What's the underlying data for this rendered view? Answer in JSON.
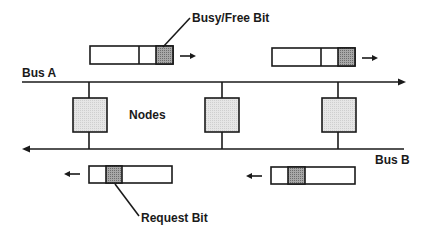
{
  "diagram": {
    "labels": {
      "busy_free_bit": "Busy/Free Bit",
      "bus_a": "Bus A",
      "nodes": "Nodes",
      "bus_b": "Bus B",
      "request_bit": "Request Bit"
    },
    "bus_a": {
      "direction": "right"
    },
    "bus_b": {
      "direction": "left"
    },
    "node_count": 3,
    "packets": [
      {
        "bus": "A",
        "highlighted_bit": "busy-free",
        "direction": "right"
      },
      {
        "bus": "A",
        "highlighted_bit": "busy-free",
        "direction": "right"
      },
      {
        "bus": "B",
        "highlighted_bit": "request",
        "direction": "left"
      },
      {
        "bus": "B",
        "highlighted_bit": "request",
        "direction": "left"
      }
    ],
    "colors": {
      "line": "#1a1a1a",
      "node_fill": "#e4e4e4",
      "bit_fill": "#9a9a9a",
      "background": "#ffffff"
    }
  }
}
